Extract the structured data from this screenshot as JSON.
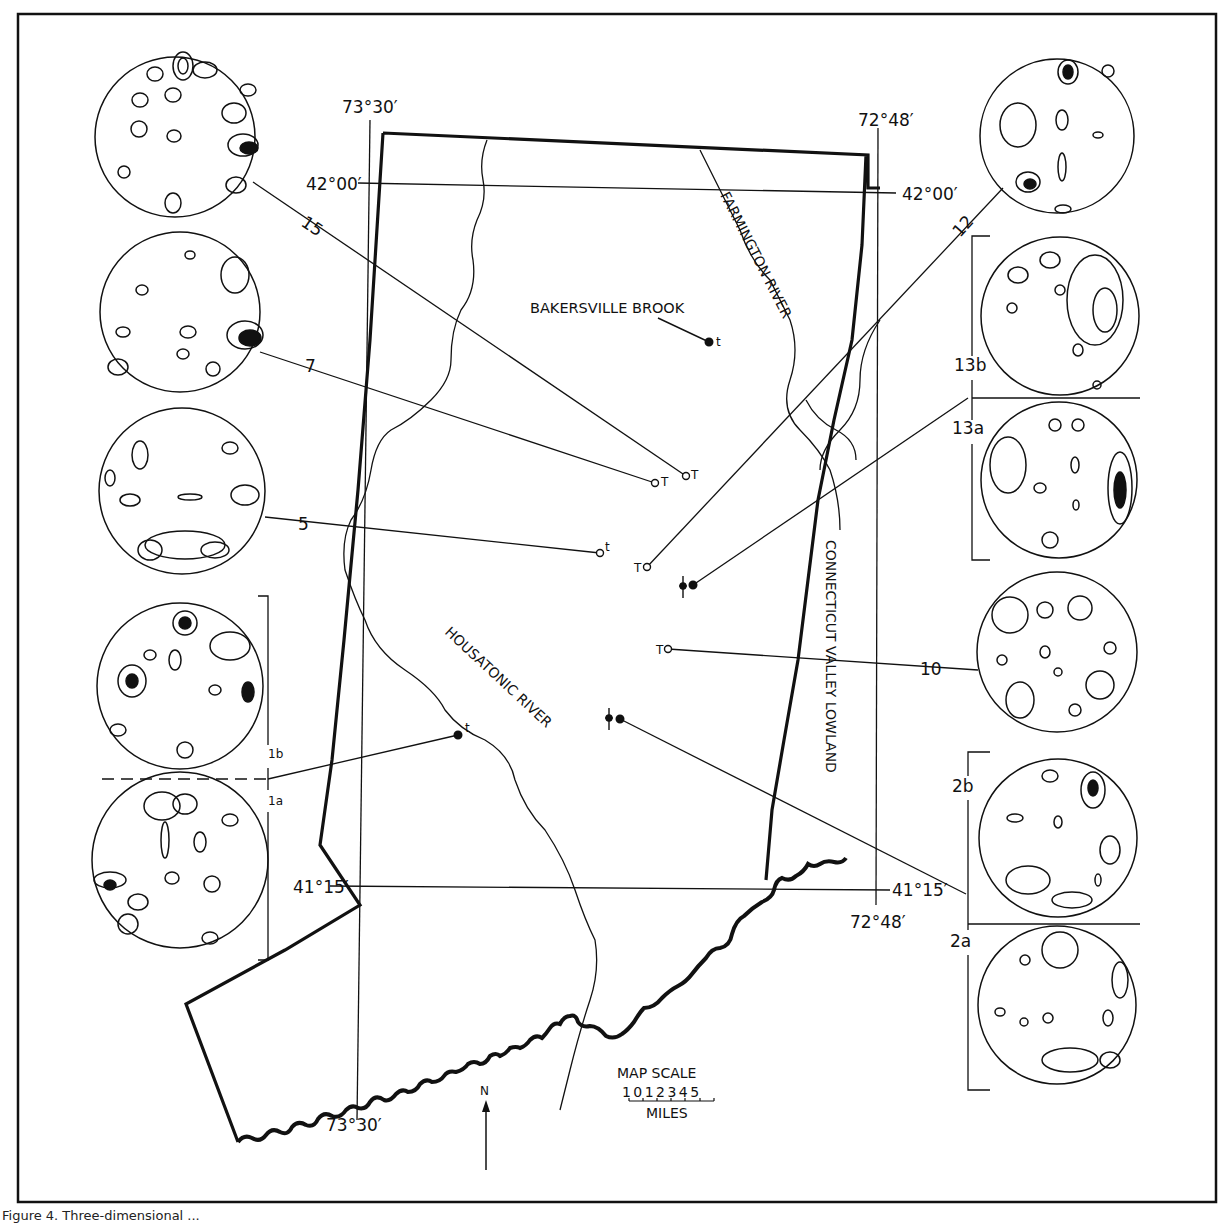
{
  "figure": {
    "caption_visible_fragment": "Figure 4. Three-dimensional ...",
    "frame": {
      "x": 18,
      "y": 14,
      "w": 1198,
      "h": 1188
    }
  },
  "graticule": {
    "lon_west": {
      "label_top": "73°30′",
      "label_bottom": "73°30′",
      "x": 370
    },
    "lon_east": {
      "label_top": "72°48′",
      "label_bottom": "72°48′",
      "x": 878
    },
    "lat_north": {
      "label_left": "42°00′",
      "label_right": "42°00′",
      "y": 183
    },
    "lat_south": {
      "label_left": "41°15′",
      "label_right": "41°15′",
      "y": 888
    }
  },
  "map_labels": {
    "bakersville": "BAKERSVILLE BROOK",
    "farmington": "FARMINGTON RIVER",
    "housatonic": "HOUSATONIC RIVER",
    "ct_valley": "CONNECTICUT VALLEY LOWLAND",
    "north": "N",
    "scale_title": "MAP SCALE",
    "scale_ticks": "1 0 1 2 3 4 5",
    "scale_units": "MILES"
  },
  "sites": [
    {
      "id": "15",
      "symbol": "open-circle",
      "tag": "T",
      "x": 686,
      "y": 476
    },
    {
      "id": "7",
      "symbol": "open-circle",
      "tag": "T",
      "x": 655,
      "y": 483
    },
    {
      "id": "5",
      "symbol": "open-circle",
      "tag": "t",
      "x": 600,
      "y": 553
    },
    {
      "id": "12",
      "symbol": "open-circle",
      "tag": "T",
      "x": 647,
      "y": 567
    },
    {
      "id": "13",
      "symbol": "dot-with-cross",
      "tag": "",
      "x": 693,
      "y": 585
    },
    {
      "id": "10",
      "symbol": "open-circle",
      "tag": "T",
      "x": 668,
      "y": 649
    },
    {
      "id": "2",
      "symbol": "dot-with-cross",
      "tag": "",
      "x": 620,
      "y": 719
    },
    {
      "id": "1",
      "symbol": "filled-dot",
      "tag": "t",
      "x": 458,
      "y": 735
    },
    {
      "id": "bakersville",
      "symbol": "filled-dot",
      "tag": "t",
      "x": 709,
      "y": 342
    }
  ],
  "stereonets": {
    "left": [
      {
        "label": "15",
        "cx": 175,
        "cy": 137,
        "r": 80
      },
      {
        "label": "7",
        "cx": 180,
        "cy": 312,
        "r": 80
      },
      {
        "label": "5",
        "cx": 182,
        "cy": 491,
        "r": 83
      },
      {
        "label": "1b",
        "cx": 180,
        "cy": 686,
        "r": 83
      },
      {
        "label": "1a",
        "cx": 180,
        "cy": 860,
        "r": 88
      }
    ],
    "right": [
      {
        "label": "12",
        "cx": 1057,
        "cy": 136,
        "r": 77
      },
      {
        "label": "13b",
        "cx": 1060,
        "cy": 316,
        "r": 79
      },
      {
        "label": "13a",
        "cx": 1059,
        "cy": 480,
        "r": 78
      },
      {
        "label": "10",
        "cx": 1057,
        "cy": 652,
        "r": 80
      },
      {
        "label": "2b",
        "cx": 1058,
        "cy": 838,
        "r": 79
      },
      {
        "label": "2a",
        "cx": 1057,
        "cy": 1005,
        "r": 79
      }
    ]
  },
  "colors": {
    "ink": "#111111",
    "paper": "#ffffff"
  }
}
